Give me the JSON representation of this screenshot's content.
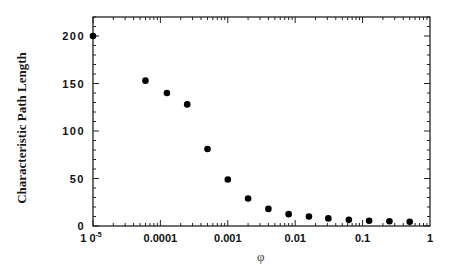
{
  "chart_data": {
    "type": "scatter",
    "title": "",
    "xlabel": "φ",
    "ylabel": "Characteristic Path Length",
    "xscale": "log",
    "xlim": [
      1e-05,
      1
    ],
    "ylim": [
      0,
      220
    ],
    "x_tick_labels": [
      "10⁻⁵",
      "0.0001",
      "0.001",
      "0.01",
      "0.1",
      "1"
    ],
    "x_tick_values": [
      1e-05,
      0.0001,
      0.001,
      0.01,
      0.1,
      1
    ],
    "y_tick_labels": [
      "0",
      "50",
      "100",
      "150",
      "200"
    ],
    "y_tick_values": [
      0,
      50,
      100,
      150,
      200
    ],
    "grid": false,
    "legend": null,
    "marker": "filled-circle",
    "color": "#000000",
    "x": [
      1e-05,
      6e-05,
      0.000125,
      0.00025,
      0.0005,
      0.001,
      0.002,
      0.004,
      0.008,
      0.016,
      0.031,
      0.0625,
      0.125,
      0.25,
      0.5
    ],
    "y": [
      200,
      153,
      140,
      128,
      81,
      49,
      29,
      18,
      12.5,
      10,
      8,
      6.5,
      5.5,
      5,
      4.5
    ]
  }
}
